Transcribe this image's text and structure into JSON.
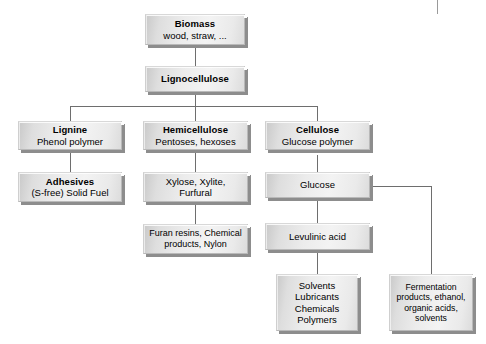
{
  "diagram": {
    "type": "flowchart",
    "background_color": "#ffffff",
    "box_fill_color": "#ededed",
    "box_shadow_color": "#8d8d8d",
    "connector_color": "#6e6e6e",
    "nodes": [
      {
        "id": "biomass",
        "title": "Biomass",
        "subtitle": "wood, straw, ...",
        "bold_title": true
      },
      {
        "id": "lignocellulose",
        "title": "Lignocellulose",
        "subtitle": "",
        "bold_title": true
      },
      {
        "id": "lignine",
        "title": "Lignine",
        "subtitle": "Phenol polymer",
        "bold_title": true
      },
      {
        "id": "hemicellulose",
        "title": "Hemicellulose",
        "subtitle": "Pentoses, hexoses",
        "bold_title": true
      },
      {
        "id": "cellulose",
        "title": "Cellulose",
        "subtitle": "Glucose polymer",
        "bold_title": true
      },
      {
        "id": "adhesives",
        "title": "Adhesives",
        "subtitle": "(S-free) Solid Fuel",
        "bold_title": true
      },
      {
        "id": "xylose",
        "line1": "Xylose, Xylite,",
        "line2": "Furfural",
        "bold_title": false
      },
      {
        "id": "glucose",
        "line1": "Glucose",
        "bold_title": false
      },
      {
        "id": "furan",
        "line1": "Furan resins, Chemical",
        "line2": "products, Nylon",
        "bold_title": false
      },
      {
        "id": "levulinic",
        "line1": "Levulinic acid",
        "bold_title": false
      },
      {
        "id": "solvents",
        "line1": "Solvents",
        "line2": "Lubricants",
        "line3": "Chemicals",
        "line4": "Polymers",
        "bold_title": false
      },
      {
        "id": "fermentation",
        "line1": "Fermentation",
        "line2": "products, ethanol,",
        "line3": "organic acids,",
        "line4": "solvents",
        "bold_title": false
      }
    ],
    "edges": [
      {
        "from": "biomass",
        "to": "lignocellulose"
      },
      {
        "from": "lignocellulose",
        "to": "lignine"
      },
      {
        "from": "lignocellulose",
        "to": "hemicellulose"
      },
      {
        "from": "lignocellulose",
        "to": "cellulose"
      },
      {
        "from": "lignine",
        "to": "adhesives"
      },
      {
        "from": "hemicellulose",
        "to": "xylose"
      },
      {
        "from": "xylose",
        "to": "furan"
      },
      {
        "from": "cellulose",
        "to": "glucose"
      },
      {
        "from": "glucose",
        "to": "levulinic"
      },
      {
        "from": "levulinic",
        "to": "solvents"
      },
      {
        "from": "glucose",
        "to": "fermentation"
      }
    ]
  }
}
